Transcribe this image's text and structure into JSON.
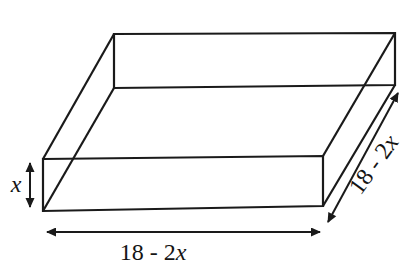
{
  "figure": {
    "colors": {
      "line": "#1a1a1a",
      "background": "#ffffff"
    },
    "labels": {
      "height": {
        "variable": "x"
      },
      "base_width": {
        "prefix": "18 - 2",
        "variable": "x"
      },
      "base_depth": {
        "prefix": "18 - 2",
        "variable": "x"
      }
    }
  }
}
